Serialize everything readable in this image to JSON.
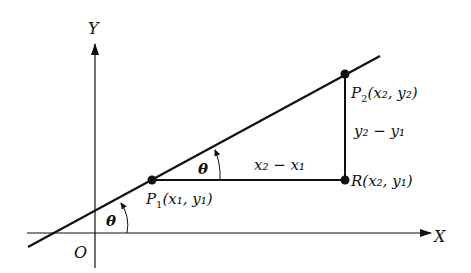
{
  "diagram": {
    "axes": {
      "x_label": "X",
      "y_label": "Y",
      "origin_label": "O"
    },
    "points": {
      "p1": {
        "name": "P",
        "sub": "1",
        "coords": "(x₁, y₁)"
      },
      "p2": {
        "name": "P",
        "sub": "2",
        "coords": "(x₂, y₂)"
      },
      "r": {
        "name": "R",
        "coords": "(x₂, y₁)"
      }
    },
    "segments": {
      "run_label": "x₂ − x₁",
      "rise_label": "y₂ − y₁"
    },
    "angles": {
      "theta_at_axis": "θ",
      "theta_at_p1": "θ"
    },
    "colors": {
      "stroke": "#111111",
      "background": "#ffffff"
    }
  }
}
